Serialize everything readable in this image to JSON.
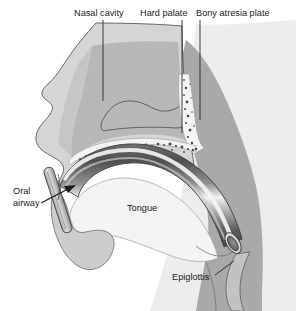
{
  "figure": {
    "background_color": "#ffffff",
    "width": 300,
    "height": 311
  },
  "palette": {
    "page_background": "#ffffff",
    "far_background_tissue": "#e9e9e9",
    "skin_soft_tissue": "#d5d5d5",
    "deep_tissue_muscle": "#a9a9a9",
    "pharynx_tissue": "#b0b0b0",
    "bone_light": "#f2f2f2",
    "bone_speckle": "#4c4c4c",
    "airway_tube_dark": "#4e4e4e",
    "airway_tube_mid": "#8d8d8d",
    "airway_tube_highlight": "#f0f0f0",
    "tube_lumen": "#6e6e6e",
    "outline_stroke": "#4a4a4a",
    "leader_stroke": "#2a2a2a",
    "label_text": "#1b1b1b"
  },
  "labels": [
    {
      "id": "nasal-cavity",
      "text": "Nasal cavity",
      "text_x": 74,
      "text_y": 15,
      "anchor": "start",
      "leader": "M 103 20 L 103 101",
      "target": "nasal cavity airspace"
    },
    {
      "id": "hard-palate",
      "text": "Hard palate",
      "text_x": 140,
      "text_y": 15,
      "anchor": "start",
      "leader": "M 182 20 L 182 133",
      "target": "hard palate bone"
    },
    {
      "id": "bony-atresia-plate",
      "text": "Bony atresia plate",
      "text_x": 196,
      "text_y": 15,
      "anchor": "start",
      "leader": "M 200 20 L 200 120",
      "target": "bony atresia plate"
    },
    {
      "id": "oral-airway",
      "text_lines": [
        "Oral",
        "airway"
      ],
      "text_x": 13,
      "text_y": 194,
      "anchor": "start",
      "leader": "M 41 202 L 74 190",
      "arrow": "M 40 207 L 72 186",
      "target": "oral airway device"
    },
    {
      "id": "tongue",
      "text": "Tongue",
      "text_x": 127,
      "text_y": 210,
      "anchor": "start",
      "leader": "",
      "target": "tongue body"
    },
    {
      "id": "epiglottis",
      "text": "Epiglottis",
      "text_x": 172,
      "text_y": 279,
      "anchor": "start",
      "leader": "M 215 275 L 232 262",
      "target": "epiglottis"
    }
  ],
  "structures": [
    {
      "id": "face-profile",
      "name": "facial soft tissue profile",
      "fill": "#d5d5d5"
    },
    {
      "id": "far-background",
      "name": "posterior background tissue",
      "fill": "#e9e9e9"
    },
    {
      "id": "deep-tissue",
      "name": "deep pharyngeal muscle mass",
      "fill": "#a9a9a9"
    },
    {
      "id": "nasal-cavity-space",
      "name": "nasal cavity airspace",
      "fill": "#bdbdbd"
    },
    {
      "id": "turbinate",
      "name": "nasal turbinate",
      "fill": "none"
    },
    {
      "id": "hard-palate-bone",
      "name": "hard palate bone with marrow speckles",
      "fill": "#f2f2f2"
    },
    {
      "id": "atresia-plate-bone",
      "name": "bony atresia plate with marrow speckles",
      "fill": "#f2f2f2"
    },
    {
      "id": "tongue-body",
      "name": "tongue",
      "fill": "#f3f3f3"
    },
    {
      "id": "mandible",
      "name": "mandible and chin",
      "fill": "#cfcfcf"
    },
    {
      "id": "epiglottis-flap",
      "name": "epiglottis flap",
      "fill": "#bfbfbf"
    },
    {
      "id": "oral-airway-tube",
      "name": "curved oral airway tube",
      "fill": "gradient"
    },
    {
      "id": "oral-airway-flange",
      "name": "oral airway bite flange",
      "fill": "#c8c8c8"
    },
    {
      "id": "oral-airway-lumen",
      "name": "distal tube lumen opening",
      "fill": "#6e6e6e"
    }
  ]
}
